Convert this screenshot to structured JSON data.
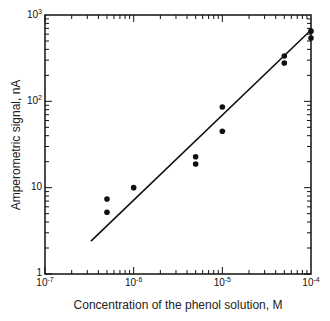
{
  "chart_data": {
    "type": "scatter",
    "title": "",
    "xlabel": "Concentration of the phenol solution,  M",
    "ylabel": "Amperometric signal, nA",
    "xscale": "log",
    "yscale": "log",
    "xlim": [
      1e-07,
      0.0001
    ],
    "ylim": [
      1,
      1000
    ],
    "grid": false,
    "legend": null,
    "x_ticks": [
      {
        "value": 1e-07,
        "base": "10",
        "exp": "-7"
      },
      {
        "value": 1e-06,
        "base": "10",
        "exp": "-6"
      },
      {
        "value": 1e-05,
        "base": "10",
        "exp": "-5"
      },
      {
        "value": 0.0001,
        "base": "10",
        "exp": "-4"
      }
    ],
    "y_ticks": [
      {
        "value": 1,
        "base": "1",
        "exp": ""
      },
      {
        "value": 10,
        "base": "10",
        "exp": ""
      },
      {
        "value": 100,
        "base": "10",
        "exp": "2"
      },
      {
        "value": 1000,
        "base": "10",
        "exp": "3"
      }
    ],
    "series": [
      {
        "name": "measurements",
        "kind": "scatter",
        "points": [
          {
            "x": 5e-07,
            "y": 7.4
          },
          {
            "x": 5e-07,
            "y": 5.2
          },
          {
            "x": 1e-06,
            "y": 10
          },
          {
            "x": 5e-06,
            "y": 22.8
          },
          {
            "x": 5e-06,
            "y": 18.8
          },
          {
            "x": 1e-05,
            "y": 86
          },
          {
            "x": 1e-05,
            "y": 45
          },
          {
            "x": 5e-05,
            "y": 335
          },
          {
            "x": 5e-05,
            "y": 278
          },
          {
            "x": 0.0001,
            "y": 650
          },
          {
            "x": 0.0001,
            "y": 540
          }
        ]
      },
      {
        "name": "fit",
        "kind": "line",
        "points": [
          {
            "x": 3.3e-07,
            "y": 2.4
          },
          {
            "x": 0.0001,
            "y": 670
          }
        ]
      }
    ]
  },
  "layout": {
    "plot_left": 45,
    "plot_right": 311,
    "plot_top": 15,
    "plot_bottom": 274,
    "ink_color": "#111111"
  }
}
